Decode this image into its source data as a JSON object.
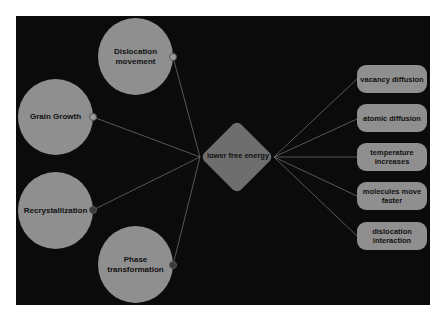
{
  "diagram": {
    "center_node": {
      "label": "lower free energy",
      "shape": "diamond"
    },
    "left_nodes": [
      {
        "label": "Dislocation movement",
        "shape": "circle"
      },
      {
        "label": "Grain Growth",
        "shape": "circle"
      },
      {
        "label": "Recrystallization",
        "shape": "circle"
      },
      {
        "label": "Phase transformation",
        "shape": "circle"
      }
    ],
    "right_nodes": [
      {
        "label": "vacancy diffusion",
        "shape": "rounded-rect"
      },
      {
        "label": "atomic diffusion",
        "shape": "rounded-rect"
      },
      {
        "label": "temperature increases",
        "shape": "rounded-rect"
      },
      {
        "label": "molecules move faster",
        "shape": "rounded-rect"
      },
      {
        "label": "dislocation interaction",
        "shape": "rounded-rect"
      }
    ],
    "colors": {
      "background": "#0b0b0b",
      "node_fill": "#8f8f8f",
      "diamond_fill": "#6e6e6e",
      "edge": "#6a6a6a"
    }
  }
}
